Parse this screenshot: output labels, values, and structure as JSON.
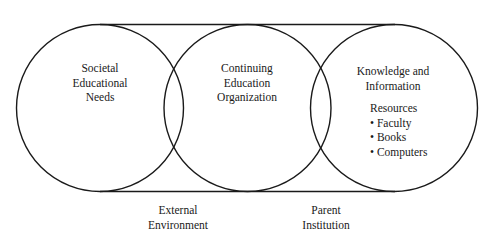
{
  "diagram": {
    "circles": [
      {
        "id": "societal-educational-needs",
        "lines": [
          "Societal",
          "Educational",
          "Needs"
        ]
      },
      {
        "id": "continuing-education-organization",
        "lines": [
          "Continuing",
          "Education",
          "Organization"
        ]
      },
      {
        "id": "knowledge-and-information",
        "lines": [
          "Knowledge and",
          "Information"
        ],
        "resources": {
          "heading": "Resources",
          "items": [
            "• Faculty",
            "• Books",
            "• Computers"
          ]
        }
      }
    ],
    "bottom_labels": [
      {
        "id": "external-environment",
        "lines": [
          "External",
          "Environment"
        ]
      },
      {
        "id": "parent-institution",
        "lines": [
          "Parent",
          "Institution"
        ]
      }
    ],
    "colors": {
      "stroke": "#1a1a1a",
      "background": "#ffffff"
    }
  }
}
